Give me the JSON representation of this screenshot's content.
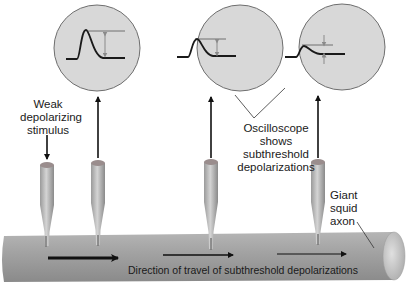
{
  "diagram": {
    "type": "neurophysiology-schematic",
    "colors": {
      "background": "#ffffff",
      "scope_fill": "#d6d6d6",
      "scope_stroke": "#6e6e6e",
      "trace": "#1a1a1a",
      "threshold_line": "#555555",
      "measure_arrow": "#8a8a8a",
      "axon_light": "#c2c2c2",
      "axon_dark": "#8f8f8f",
      "electrode_light": "#c8c8c8",
      "electrode_dark": "#8d8d8d",
      "electrode_cap": "#9a8a8a",
      "arrow": "#111111",
      "text": "#1a1a1a"
    },
    "labels": {
      "stimulus": [
        "Weak",
        "depolarizing",
        "stimulus"
      ],
      "oscilloscope": [
        "Oscilloscope",
        "shows",
        "subthreshold",
        "depolarizations"
      ],
      "axon": [
        "Giant",
        "squid",
        "axon"
      ],
      "direction": "Direction of travel of subthreshold depolarizations"
    },
    "oscilloscopes": [
      {
        "id": "scope-1",
        "cx": 97,
        "cy": 48,
        "r": 43,
        "amplitude": "large"
      },
      {
        "id": "scope-2",
        "cx": 240,
        "cy": 48,
        "r": 43,
        "amplitude": "medium"
      },
      {
        "id": "scope-3",
        "cx": 342,
        "cy": 47,
        "r": 43,
        "amplitude": "small"
      }
    ],
    "electrodes": [
      {
        "id": "stimulating-electrode",
        "x": 47,
        "role": "stimulus"
      },
      {
        "id": "recording-electrode-1",
        "x": 97,
        "role": "recording"
      },
      {
        "id": "recording-electrode-2",
        "x": 210,
        "role": "recording"
      },
      {
        "id": "recording-electrode-3",
        "x": 318,
        "role": "recording"
      }
    ],
    "propagation_arrows": [
      {
        "x1": 48,
        "x2": 126,
        "y": 258,
        "weight": "thick"
      },
      {
        "x1": 163,
        "x2": 238,
        "y": 255,
        "weight": "medium"
      },
      {
        "x1": 277,
        "x2": 350,
        "y": 254,
        "weight": "thin"
      }
    ]
  }
}
